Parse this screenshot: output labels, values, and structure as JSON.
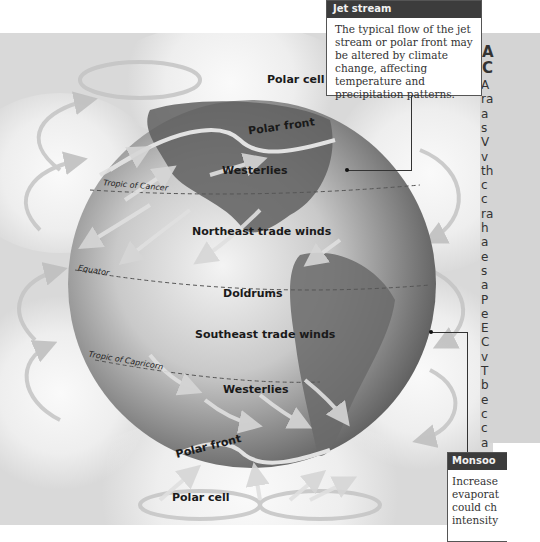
{
  "diagram": {
    "type": "global atmospheric circulation",
    "labels": {
      "polar_cell_north": "Polar cell",
      "polar_front_north": "Polar front",
      "westerlies_north": "Westerlies",
      "tropic_of_cancer": "Tropic of Cancer",
      "ne_trades": "Northeast trade winds",
      "equator": "Equator",
      "doldrums": "Doldrums",
      "se_trades": "Southeast trade winds",
      "tropic_of_capricorn": "Tropic of Capricorn",
      "westerlies_south": "Westerlies",
      "polar_front_south": "Polar front",
      "polar_cell_south": "Polar cell"
    },
    "colors": {
      "globe_dark": "#5a5a5a",
      "globe_light": "#f2f2f2",
      "arrow": "#c8c8c8",
      "callout_header": "#3c3c3c"
    }
  },
  "callouts": {
    "jet_stream": {
      "title": "Jet stream",
      "text": "The typical flow of the jet stream or polar front may be altered by climate change, affecting temperature and precipitation patterns."
    },
    "monsoon": {
      "title": "Monsoo",
      "lines": [
        "Increase",
        "evaporat",
        "could ch",
        "intensity"
      ]
    }
  },
  "side_text": {
    "heading_lines": [
      "A",
      "C"
    ],
    "body_letters": [
      "A",
      "ra",
      "a",
      "s",
      "V",
      "v",
      "th",
      "c",
      "c",
      "ra",
      "h",
      "a",
      "e",
      "s",
      "a",
      "P",
      "e",
      "E",
      "C",
      "v",
      "T",
      "b",
      "e",
      "c",
      "c",
      "a"
    ]
  }
}
